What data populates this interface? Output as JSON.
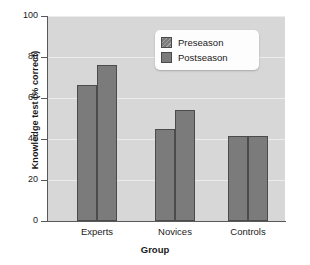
{
  "chart_data": {
    "type": "bar",
    "title": "",
    "xlabel": "Group",
    "ylabel": "Knowledge test (% correct)",
    "categories": [
      "Experts",
      "Novices",
      "Controls"
    ],
    "series": [
      {
        "name": "Preseason",
        "values": [
          66.5,
          45.0,
          41.5
        ]
      },
      {
        "name": "Postseason",
        "values": [
          76.0,
          54.0,
          41.5
        ]
      }
    ],
    "ylim": [
      0,
      100
    ],
    "yticks": [
      0,
      20,
      40,
      60,
      80,
      100
    ],
    "ytick_labels": [
      "0",
      "20",
      "40",
      "60",
      "80",
      "100"
    ],
    "grid": true,
    "grid_axis": "y",
    "legend_position": "top-right-inside",
    "plot_background": "#d7d7d7",
    "grid_color": "#ececec",
    "bar_fill": "#7b7b7b",
    "bar_edge": "#4b4b4b",
    "axis_color": "#59595a",
    "text_color": "#1a1a1a",
    "figure_background": "#ffffff"
  }
}
